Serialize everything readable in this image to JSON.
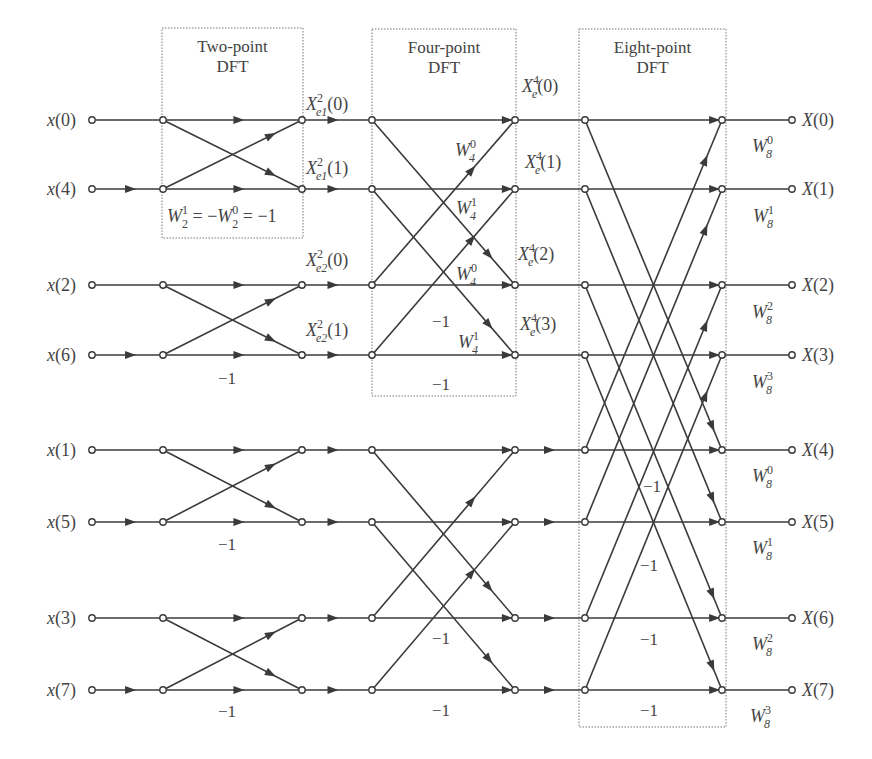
{
  "colors": {
    "line": "#3a3a3a",
    "text": "#444444",
    "box": "#777777",
    "background": "#ffffff"
  },
  "boxes": [
    {
      "id": "two-point-dft-box",
      "line1": "Two-point",
      "line2": "DFT",
      "x": 162,
      "y": 28,
      "w": 141,
      "h": 210
    },
    {
      "id": "four-point-dft-box",
      "line1": "Four-point",
      "line2": "DFT",
      "x": 372,
      "y": 29,
      "w": 144,
      "h": 367
    },
    {
      "id": "eight-point-dft-box",
      "line1": "Eight-point",
      "line2": "DFT",
      "x": 579,
      "y": 29,
      "w": 147,
      "h": 698
    }
  ],
  "rows_y": [
    120,
    189,
    285,
    355,
    450,
    522,
    618,
    690
  ],
  "columns_x": {
    "input": 92,
    "stage1_in": 163,
    "stage1_out": 302,
    "stage2_in": 372,
    "stage2_out": 515,
    "stage3_in": 585,
    "stage3_out": 722,
    "output": 792
  },
  "inputs": [
    "x(0)",
    "x(4)",
    "x(2)",
    "x(6)",
    "x(1)",
    "x(5)",
    "x(3)",
    "x(7)"
  ],
  "outputs": [
    "X(0)",
    "X(1)",
    "X(2)",
    "X(3)",
    "X(4)",
    "X(5)",
    "X(6)",
    "X(7)"
  ],
  "intermediate_labels": [
    {
      "base": "X",
      "sup": "2",
      "sub": "e1",
      "arg": "(0)",
      "x": 306,
      "y": 110
    },
    {
      "base": "X",
      "sup": "2",
      "sub": "e1",
      "arg": "(1)",
      "x": 306,
      "y": 174
    },
    {
      "base": "X",
      "sup": "2",
      "sub": "e2",
      "arg": "(0)",
      "x": 306,
      "y": 266
    },
    {
      "base": "X",
      "sup": "2",
      "sub": "e2",
      "arg": "(1)",
      "x": 306,
      "y": 336
    },
    {
      "base": "X",
      "sup": "4",
      "sub": "e",
      "arg": "(0)",
      "x": 522,
      "y": 92
    },
    {
      "base": "X",
      "sup": "4",
      "sub": "e",
      "arg": "(1)",
      "x": 525,
      "y": 168
    },
    {
      "base": "X",
      "sup": "4",
      "sub": "e",
      "arg": "(2)",
      "x": 518,
      "y": 260
    },
    {
      "base": "X",
      "sup": "4",
      "sub": "e",
      "arg": "(3)",
      "x": 520,
      "y": 330
    }
  ],
  "twiddle_labels": [
    {
      "base": "W",
      "sup": "0",
      "sub": "4",
      "x": 455,
      "y": 156
    },
    {
      "base": "W",
      "sup": "1",
      "sub": "4",
      "x": 456,
      "y": 214
    },
    {
      "base": "W",
      "sup": "0",
      "sub": "4",
      "x": 456,
      "y": 280
    },
    {
      "base": "W",
      "sup": "1",
      "sub": "4",
      "x": 458,
      "y": 348
    },
    {
      "base": "W",
      "sup": "0",
      "sub": "8",
      "x": 752,
      "y": 152
    },
    {
      "base": "W",
      "sup": "1",
      "sub": "8",
      "x": 753,
      "y": 222
    },
    {
      "base": "W",
      "sup": "2",
      "sub": "8",
      "x": 752,
      "y": 318
    },
    {
      "base": "W",
      "sup": "3",
      "sub": "8",
      "x": 752,
      "y": 388
    },
    {
      "base": "W",
      "sup": "0",
      "sub": "8",
      "x": 752,
      "y": 482
    },
    {
      "base": "W",
      "sup": "1",
      "sub": "8",
      "x": 752,
      "y": 554
    },
    {
      "base": "W",
      "sup": "2",
      "sub": "8",
      "x": 752,
      "y": 650
    },
    {
      "base": "W",
      "sup": "3",
      "sub": "8",
      "x": 750,
      "y": 722
    }
  ],
  "identity_label": {
    "text_a": "W",
    "sup_a": "1",
    "sub_a": "2",
    "mid": " = −",
    "text_b": "W",
    "sup_b": "0",
    "sub_b": "2",
    "end": " = −1",
    "x": 167,
    "y": 222
  },
  "minus_one_labels": [
    {
      "text": "−1",
      "x": 218,
      "y": 384
    },
    {
      "text": "−1",
      "x": 218,
      "y": 550
    },
    {
      "text": "−1",
      "x": 218,
      "y": 717
    },
    {
      "text": "−1",
      "x": 432,
      "y": 327
    },
    {
      "text": "−1",
      "x": 432,
      "y": 390
    },
    {
      "text": "−1",
      "x": 432,
      "y": 644
    },
    {
      "text": "−1",
      "x": 432,
      "y": 716
    },
    {
      "text": "−1",
      "x": 643,
      "y": 492
    },
    {
      "text": "−1",
      "x": 640,
      "y": 571
    },
    {
      "text": "−1",
      "x": 640,
      "y": 645
    },
    {
      "text": "−1",
      "x": 640,
      "y": 716
    }
  ]
}
